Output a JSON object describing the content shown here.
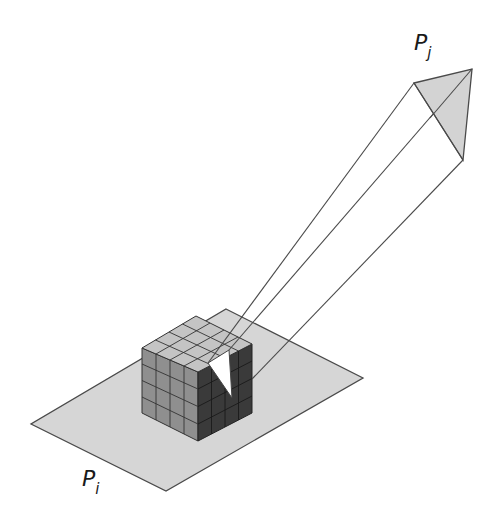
{
  "diagram": {
    "labels": {
      "patch_i": {
        "base": "P",
        "sub": "i"
      },
      "patch_j": {
        "base": "P",
        "sub": "j"
      }
    },
    "colors": {
      "plane_fill": "#d6d6d6",
      "cube_top": "#c4c4c4",
      "cube_left": "#8f8f8f",
      "cube_right": "#3a3a3a",
      "patch_j_fill": "#d3d3d3",
      "projection_fill": "#ffffff",
      "stroke": "#4a4a4a"
    },
    "cube_grid": {
      "rows": 4,
      "cols": 4
    }
  }
}
